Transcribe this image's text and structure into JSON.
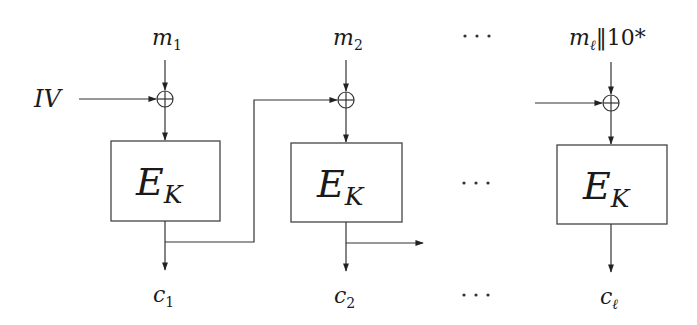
{
  "diagram": {
    "iv_label": "IV",
    "blocks": [
      {
        "input": {
          "base": "m",
          "sub": "1",
          "suffix": ""
        },
        "cipher": {
          "base": "E",
          "sub": "K"
        },
        "output": {
          "base": "c",
          "sub": "1"
        }
      },
      {
        "input": {
          "base": "m",
          "sub": "2",
          "suffix": ""
        },
        "cipher": {
          "base": "E",
          "sub": "K"
        },
        "output": {
          "base": "c",
          "sub": "2"
        }
      },
      {
        "input": {
          "base": "m",
          "sub": "ℓ",
          "suffix": "‖10*"
        },
        "cipher": {
          "base": "E",
          "sub": "K"
        },
        "output": {
          "base": "c",
          "sub": "ℓ"
        }
      }
    ],
    "ellipsis": "···",
    "xor_symbol": "⊕",
    "colors": {
      "line": "#333333",
      "box_border": "#444444",
      "text": "#1a1a1a",
      "background": "#ffffff"
    }
  }
}
